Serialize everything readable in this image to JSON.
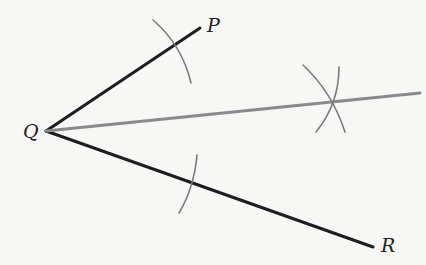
{
  "diagram": {
    "colors": {
      "ray": "#1e1e1e",
      "bisector": "#8a8a8a",
      "arc": "#7a7a7a",
      "background": "#f7f7f5"
    },
    "points": {
      "P": {
        "label": "P",
        "x": 200,
        "y": 28
      },
      "Q": {
        "label": "Q",
        "x": 46,
        "y": 131
      },
      "R": {
        "label": "R",
        "x": 373,
        "y": 247
      },
      "bisector_end": {
        "x": 420,
        "y": 93
      }
    },
    "labels": {
      "P": "P",
      "Q": "Q",
      "R": "R"
    }
  }
}
